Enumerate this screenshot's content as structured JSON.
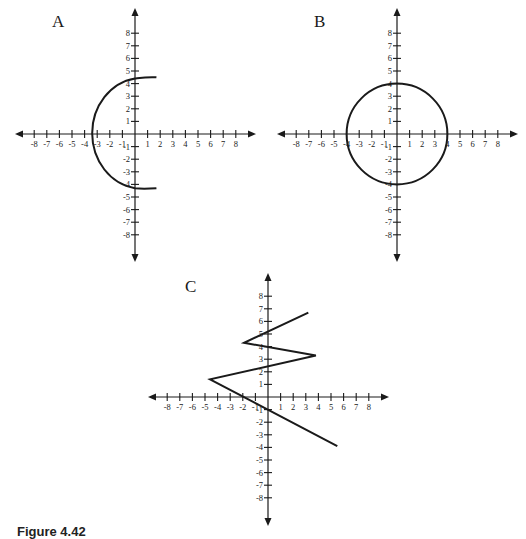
{
  "caption": "Figure 4.42",
  "chart_data": [
    {
      "type": "line",
      "title": "A",
      "xlabel": "",
      "ylabel": "",
      "xlim": [
        -8,
        8
      ],
      "ylim": [
        -8,
        8
      ],
      "x_ticks": [
        -8,
        -7,
        -6,
        -5,
        -4,
        -3,
        -2,
        -1,
        1,
        2,
        3,
        4,
        5,
        6,
        7,
        8
      ],
      "y_ticks": [
        -8,
        -7,
        -6,
        -5,
        -4,
        -3,
        -2,
        -1,
        1,
        2,
        3,
        4,
        5,
        6,
        7,
        8
      ],
      "grid": false,
      "description": "Left half of a circle (C-shaped arc) opening to the right",
      "series": [
        {
          "name": "arc",
          "points": [
            [
              1.7,
              4.5
            ],
            [
              0,
              4.4
            ],
            [
              -2.5,
              3.3
            ],
            [
              -3.6,
              0
            ],
            [
              -2.5,
              -3.3
            ],
            [
              0,
              -4.3
            ],
            [
              1.7,
              -4.3
            ]
          ]
        }
      ]
    },
    {
      "type": "line",
      "title": "B",
      "xlabel": "",
      "ylabel": "",
      "xlim": [
        -8,
        8
      ],
      "ylim": [
        -8,
        8
      ],
      "x_ticks": [
        -8,
        -7,
        -6,
        -5,
        -4,
        -3,
        -2,
        -1,
        1,
        2,
        3,
        4,
        5,
        6,
        7,
        8
      ],
      "y_ticks": [
        -8,
        -7,
        -6,
        -5,
        -4,
        -3,
        -2,
        -1,
        1,
        2,
        3,
        4,
        5,
        6,
        7,
        8
      ],
      "grid": false,
      "description": "Full circle centered at origin with radius 4",
      "series": [
        {
          "name": "circle",
          "center": [
            0,
            0
          ],
          "radius": 4
        }
      ]
    },
    {
      "type": "line",
      "title": "C",
      "xlabel": "",
      "ylabel": "",
      "xlim": [
        -8,
        8
      ],
      "ylim": [
        -8,
        8
      ],
      "x_ticks": [
        -8,
        -7,
        -6,
        -5,
        -4,
        -3,
        -2,
        -1,
        1,
        2,
        3,
        4,
        5,
        6,
        7,
        8
      ],
      "y_ticks": [
        -8,
        -7,
        -6,
        -5,
        -4,
        -3,
        -2,
        -1,
        1,
        2,
        3,
        4,
        5,
        6,
        7,
        8
      ],
      "grid": false,
      "description": "Zigzag polyline",
      "series": [
        {
          "name": "zigzag",
          "points": [
            [
              3.2,
              6.7
            ],
            [
              -1.9,
              4.3
            ],
            [
              3.8,
              3.3
            ],
            [
              -4.6,
              1.4
            ],
            [
              5.5,
              -3.9
            ]
          ]
        }
      ]
    }
  ],
  "panels": {
    "a": {
      "label": "A"
    },
    "b": {
      "label": "B"
    },
    "c": {
      "label": "C"
    }
  }
}
